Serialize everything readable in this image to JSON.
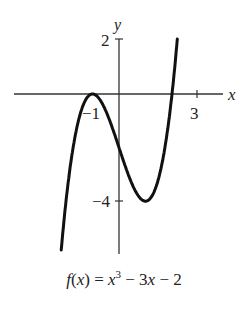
{
  "chart_data": {
    "type": "line",
    "title": "",
    "function": "f(x) = x^3 - 3x - 2",
    "caption": {
      "prefix": "f(x) = x",
      "exp": "3",
      "suffix": " − 3x − 2"
    },
    "xlabel": "x",
    "ylabel": "y",
    "x_ticks": [
      {
        "value": -1,
        "label": "−1"
      },
      {
        "value": 3,
        "label": "3"
      }
    ],
    "y_ticks": [
      {
        "value": 2,
        "label": "2"
      },
      {
        "value": -4,
        "label": "−4"
      }
    ],
    "xlim": [
      -4,
      4
    ],
    "ylim": [
      -6.3,
      2.2
    ],
    "grid": false,
    "points": {
      "x": [
        -2.35,
        -2,
        -1.5,
        -1,
        -0.5,
        0,
        0.5,
        1,
        1.5,
        2,
        2.3
      ],
      "y": [
        -7.93,
        -4,
        -0.875,
        0,
        -0.625,
        -2,
        -3.375,
        -4,
        -3.125,
        0,
        3.27
      ]
    },
    "key_points": [
      {
        "x": -1,
        "y": 0,
        "note": "local max / double root"
      },
      {
        "x": 1,
        "y": -4,
        "note": "local min"
      },
      {
        "x": 2,
        "y": 0,
        "note": "root"
      }
    ]
  },
  "labels": {
    "x_axis": "x",
    "y_axis": "y",
    "tick_neg1": "−1",
    "tick_3": "3",
    "tick_2": "2",
    "tick_neg4": "−4"
  },
  "caption": {
    "f": "f",
    "x1": "x",
    "eq": " = ",
    "x2": "x",
    "exp": "3",
    "rest1": " − 3",
    "x3": "x",
    "rest2": " − 2"
  }
}
